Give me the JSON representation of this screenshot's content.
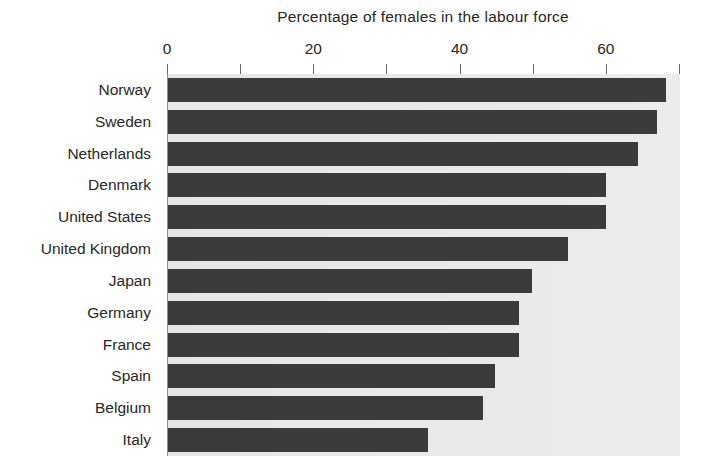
{
  "chart_data": {
    "type": "bar",
    "orientation": "horizontal",
    "title": "Percentage of females in the labour force",
    "xlabel": "",
    "ylabel": "",
    "xlim": [
      0,
      70
    ],
    "xticks": [
      0,
      10,
      20,
      30,
      40,
      50,
      60,
      70
    ],
    "xtick_labels": [
      "0",
      "",
      "20",
      "",
      "40",
      "",
      "60",
      ""
    ],
    "grid": false,
    "legend": false,
    "bar_color": "#3b3b3b",
    "plot_background": "#e8e8e8",
    "categories": [
      "Norway",
      "Sweden",
      "Netherlands",
      "Denmark",
      "United States",
      "United Kingdom",
      "Japan",
      "Germany",
      "France",
      "Spain",
      "Belgium",
      "Italy"
    ],
    "values": [
      68.1,
      66.8,
      64.3,
      59.9,
      59.9,
      54.7,
      49.7,
      48.0,
      48.0,
      44.7,
      43.1,
      35.5
    ]
  }
}
